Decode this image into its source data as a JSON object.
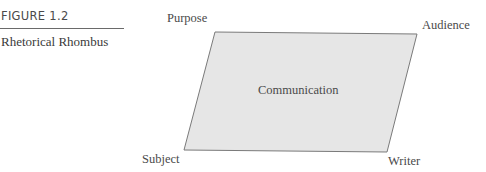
{
  "figure": {
    "number": "FIGURE 1.2",
    "title": "Rhetorical Rhombus"
  },
  "diagram": {
    "center_label": "Communication",
    "corners": {
      "top_left": "Purpose",
      "top_right": "Audience",
      "bottom_left": "Subject",
      "bottom_right": "Writer"
    },
    "fill_color": "#e6e6e6",
    "stroke_color": "#7a7a7a"
  }
}
